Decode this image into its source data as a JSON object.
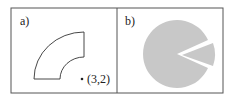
{
  "panels": [
    {
      "label": "a)",
      "shape": "annular-sector",
      "point": {
        "label": "(3,2)"
      }
    },
    {
      "label": "b)",
      "shape": "pie-with-exploded-wedge",
      "fill_color": "#c8c8c8"
    }
  ],
  "colors": {
    "border": "#555555",
    "stroke": "#333333",
    "pie_fill": "#c8c8c8"
  }
}
